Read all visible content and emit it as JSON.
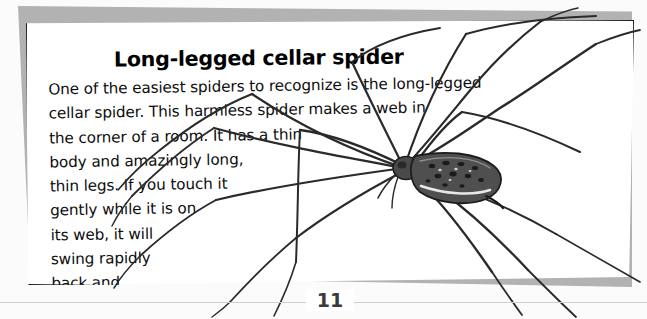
{
  "page": {
    "title": "Long-legged cellar spider",
    "body_lines": [
      "One of the easiest spiders to recognize is the long-legged",
      "cellar spider. This harmless spider makes a web in",
      "the corner of a room. It has a thin",
      "body and amazingly long,",
      "thin legs. If you touch it",
      "gently while it is on",
      "its web, it will",
      "swing rapidly",
      "back and",
      "forth."
    ],
    "folio": "11",
    "colors": {
      "paper": "#ffffff",
      "scan_background": "#fbfbfb",
      "page_shadow": "#b2b2b2",
      "page_border": "#1a1a1a",
      "ink": "#0d0d0d",
      "folio_rule": "#cfcfcf",
      "folio_text": "#3b3b3b",
      "illustration_ink": "#2a2a2a",
      "illustration_body": "#3a3a3a"
    },
    "illustration": {
      "name": "long-legged-cellar-spider-illustration",
      "subject": "cellar spider",
      "description": "Black and white line drawing of a long-legged cellar spider with a slender elongated mottled abdomen and eight extremely long thin jointed legs radiating outward past the page edges."
    }
  }
}
